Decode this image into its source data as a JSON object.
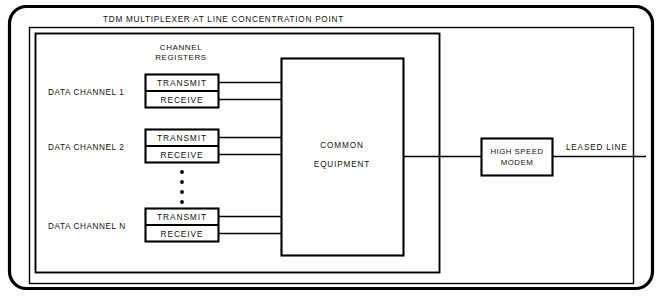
{
  "diagram": {
    "title": "TDM MULTIPLEXER AT LINE CONCENTRATION POINT",
    "column_header": {
      "line1": "CHANNEL",
      "line2": "REGISTERS"
    },
    "channels": [
      {
        "label": "DATA CHANNEL 1",
        "registers": [
          "TRANSMIT",
          "RECEIVE"
        ]
      },
      {
        "label": "DATA CHANNEL 2",
        "registers": [
          "TRANSMIT",
          "RECEIVE"
        ]
      },
      {
        "label": "DATA CHANNEL N",
        "registers": [
          "TRANSMIT",
          "RECEIVE"
        ]
      }
    ],
    "ellipsis_dots": 4,
    "common_equipment": {
      "line1": "COMMON",
      "line2": "EQUIPMENT"
    },
    "modem": {
      "line1": "HIGH SPEED",
      "line2": "MODEM"
    },
    "leased_line_label": "LEASED LINE",
    "colors": {
      "ink": "#000000",
      "paper": "#ffffff"
    }
  }
}
